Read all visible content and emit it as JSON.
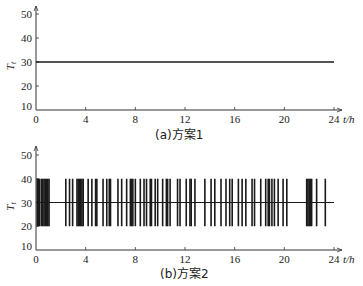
{
  "chart_data": [
    {
      "type": "line",
      "title": "(a)方案1",
      "xlabel": "t/h",
      "ylabel": "T_t",
      "xlim": [
        0,
        24
      ],
      "ylim": [
        10,
        50
      ],
      "xticks": [
        0,
        4,
        8,
        12,
        16,
        20,
        24
      ],
      "yticks": [
        10,
        20,
        30,
        40,
        50
      ],
      "grid": false,
      "legend": null,
      "series": [
        {
          "name": "T_t",
          "x": [
            0,
            24
          ],
          "values": [
            30,
            30
          ]
        }
      ]
    },
    {
      "type": "line",
      "title": "(b)方案2",
      "xlabel": "t/h",
      "ylabel": "T_t",
      "xlim": [
        0,
        24
      ],
      "ylim": [
        10,
        50
      ],
      "xticks": [
        0,
        4,
        8,
        12,
        16,
        20,
        24
      ],
      "yticks": [
        10,
        20,
        30,
        40,
        50
      ],
      "grid": false,
      "legend": null,
      "baseline": 30,
      "pulse_low": 20,
      "pulse_high": 40,
      "description": "Setpoint stays at 30 with frequent rapid switching pulses between 20 and 40",
      "series": [
        {
          "name": "T_t",
          "baseline": 30,
          "pulse_times_h": [
            0.1,
            0.2,
            0.3,
            0.45,
            0.55,
            0.65,
            0.75,
            0.85,
            0.95,
            1.05,
            2.4,
            2.7,
            2.95,
            3.3,
            3.4,
            3.5,
            3.6,
            3.7,
            3.8,
            4.2,
            4.5,
            4.8,
            4.9,
            5.4,
            5.7,
            5.9,
            6.0,
            6.6,
            6.9,
            7.3,
            7.6,
            7.7,
            7.8,
            8.0,
            8.4,
            8.7,
            8.9,
            9.2,
            9.3,
            9.6,
            9.8,
            10.2,
            10.5,
            10.6,
            10.8,
            11.4,
            11.6,
            12.1,
            12.4,
            12.5,
            12.8,
            13.6,
            14.1,
            14.4,
            14.9,
            15.3,
            15.6,
            15.8,
            16.3,
            16.6,
            16.9,
            17.4,
            17.6,
            18.1,
            18.5,
            18.7,
            18.8,
            19.0,
            19.2,
            19.5,
            19.9,
            20.2,
            21.8,
            21.9,
            22.0,
            22.1,
            22.2,
            22.6,
            23.3
          ]
        }
      ]
    }
  ],
  "panels": [
    {
      "caption": "(a)方案1",
      "ylabel": "T",
      "ylabel_sub": "t",
      "xlabel": "t/h",
      "y_tick_labels": [
        "50",
        "40",
        "30",
        "20",
        "10"
      ],
      "x_tick_labels": [
        "0",
        "4",
        "8",
        "12",
        "16",
        "20",
        "24"
      ]
    },
    {
      "caption": "(b)方案2",
      "ylabel": "T",
      "ylabel_sub": "t",
      "xlabel": "t/h",
      "y_tick_labels": [
        "50",
        "40",
        "30",
        "20",
        "10"
      ],
      "x_tick_labels": [
        "0",
        "4",
        "8",
        "12",
        "16",
        "20",
        "24"
      ]
    }
  ],
  "colors": {
    "ink": "#1a1a1a",
    "axis": "#333333",
    "background": "#ffffff"
  }
}
